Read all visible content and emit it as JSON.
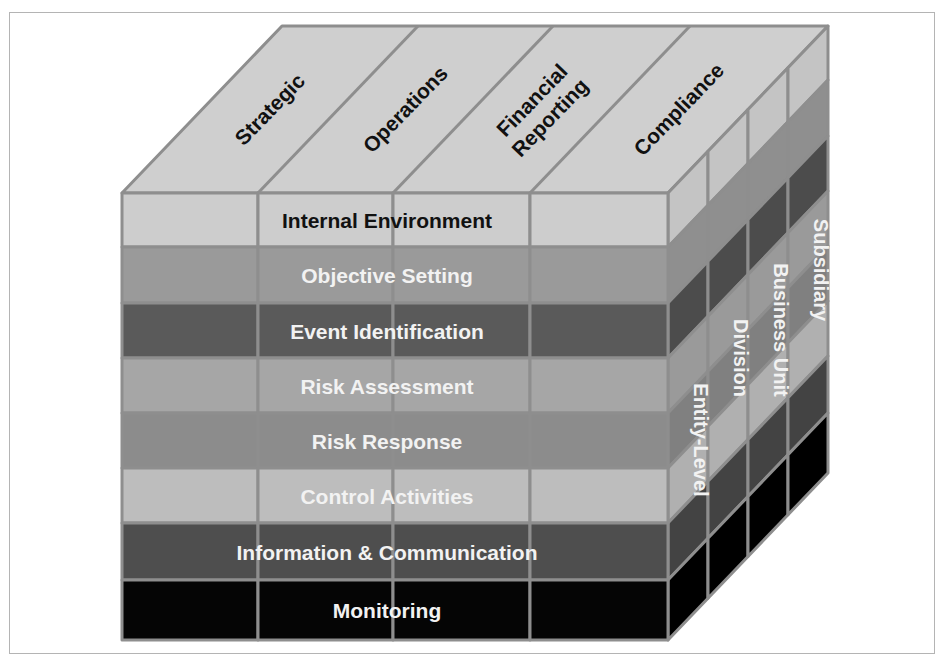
{
  "diagram": {
    "top_face": {
      "labels": [
        "Strategic",
        "Operations",
        "Financial Reporting",
        "Compliance"
      ],
      "label_lines": [
        [
          "Strategic"
        ],
        [
          "Operations"
        ],
        [
          "Financial",
          "Reporting"
        ],
        [
          "Compliance"
        ]
      ],
      "fill": "#cfcfcf",
      "text_color": "#111111"
    },
    "front_face": {
      "rows": [
        {
          "label": "Internal Environment",
          "fill": "#cdcdcd",
          "text_color": "#111111"
        },
        {
          "label": "Objective Setting",
          "fill": "#9a9a9a",
          "text_color": "#f2f2f2"
        },
        {
          "label": "Event Identification",
          "fill": "#5a5a5a",
          "text_color": "#f2f2f2"
        },
        {
          "label": "Risk Assessment",
          "fill": "#a6a6a6",
          "text_color": "#f2f2f2"
        },
        {
          "label": "Risk Response",
          "fill": "#8c8c8c",
          "text_color": "#f2f2f2"
        },
        {
          "label": "Control Activities",
          "fill": "#bdbdbd",
          "text_color": "#f2f2f2"
        },
        {
          "label": "Information & Communication",
          "fill": "#4e4e4e",
          "text_color": "#f2f2f2"
        },
        {
          "label": "Monitoring",
          "fill": "#050505",
          "text_color": "#f2f2f2"
        }
      ]
    },
    "right_face": {
      "labels": [
        "Entity-Level",
        "Division",
        "Business Unit",
        "Subsidiary"
      ],
      "text_color": "#f2f2f2"
    },
    "grid_line_color": "#8e8e8e",
    "frame_color": "#b4b4b4"
  }
}
